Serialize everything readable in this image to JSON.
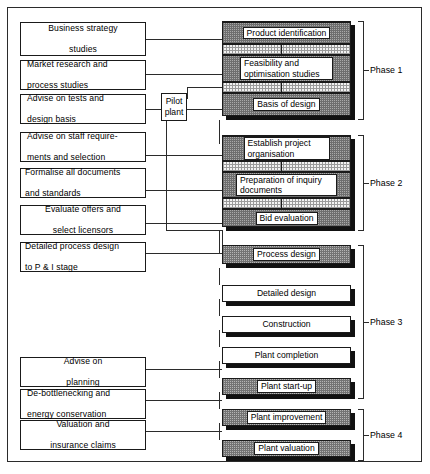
{
  "diagram": {
    "colors": {
      "frame": "#2b2b2b",
      "shadow": "#111111",
      "dark_band": "#a9a9a9",
      "light_band": "#f2f2f2",
      "shaded_box": "#b4b4b4",
      "background": "#ffffff"
    }
  },
  "left_boxes": [
    {
      "label": "Business strategy studies",
      "line1": "Business strategy",
      "line2": "studies"
    },
    {
      "label": "Market research and process studies",
      "line1": "Market research and",
      "line2": "process studies"
    },
    {
      "label": "Advise on tests and design basis",
      "line1": "Advise on tests and",
      "line2": "design basis"
    },
    {
      "label": "Advise on staff requirements and selection",
      "line1": "Advise on staff require-",
      "line2": "ments and selection"
    },
    {
      "label": "Formalise all documents and standards",
      "line1": "Formalise all documents",
      "line2": "and standards"
    },
    {
      "label": "Evaluate offers and select licensors",
      "line1": "Evaluate offers and",
      "line2": "select licensors"
    },
    {
      "label": "Detailed process design to P & I stage",
      "line1": "Detailed process design",
      "line2": "to P & I stage"
    },
    {
      "label": "Advise on planning",
      "line1": "Advise on",
      "line2": "planning"
    },
    {
      "label": "De-bottlenecking and energy conservation",
      "line1": "De-bottlenecking and",
      "line2": "energy conservation"
    },
    {
      "label": "Valuation and insurance claims",
      "line1": "Valuation and",
      "line2": "insurance claims"
    }
  ],
  "pilot_plant": {
    "line1": "Pilot",
    "line2": "plant",
    "label": "Pilot plant"
  },
  "main_steps": [
    {
      "label": "Product identification",
      "style": "dark-band",
      "phase": 1
    },
    {
      "label": "Feasibility and optimisation studies",
      "line1": "Feasibility and",
      "line2": "optimisation studies",
      "style": "dark-band",
      "phase": 1
    },
    {
      "label": "Basis of design",
      "style": "dark-band",
      "phase": 1
    },
    {
      "label": "Establish project organisation",
      "line1": "Establish project",
      "line2": "organisation",
      "style": "dark-band",
      "phase": 2
    },
    {
      "label": "Preparation of inquiry documents",
      "line1": "Preparation of inquiry",
      "line2": "documents",
      "style": "dark-band",
      "phase": 2
    },
    {
      "label": "Bid evaluation",
      "style": "dark-band",
      "phase": 2
    },
    {
      "label": "Process design",
      "style": "shaded",
      "phase": 3
    },
    {
      "label": "Detailed design",
      "style": "plain",
      "phase": 3
    },
    {
      "label": "Construction",
      "style": "plain",
      "phase": 3
    },
    {
      "label": "Plant completion",
      "style": "plain",
      "phase": 3
    },
    {
      "label": "Plant start-up",
      "style": "shaded",
      "phase": 3
    },
    {
      "label": "Plant improvement",
      "style": "shaded",
      "phase": 4
    },
    {
      "label": "Plant valuation",
      "style": "shaded",
      "phase": 4
    }
  ],
  "phases": [
    {
      "label": "Phase 1"
    },
    {
      "label": "Phase 2"
    },
    {
      "label": "Phase 3"
    },
    {
      "label": "Phase 4"
    }
  ]
}
